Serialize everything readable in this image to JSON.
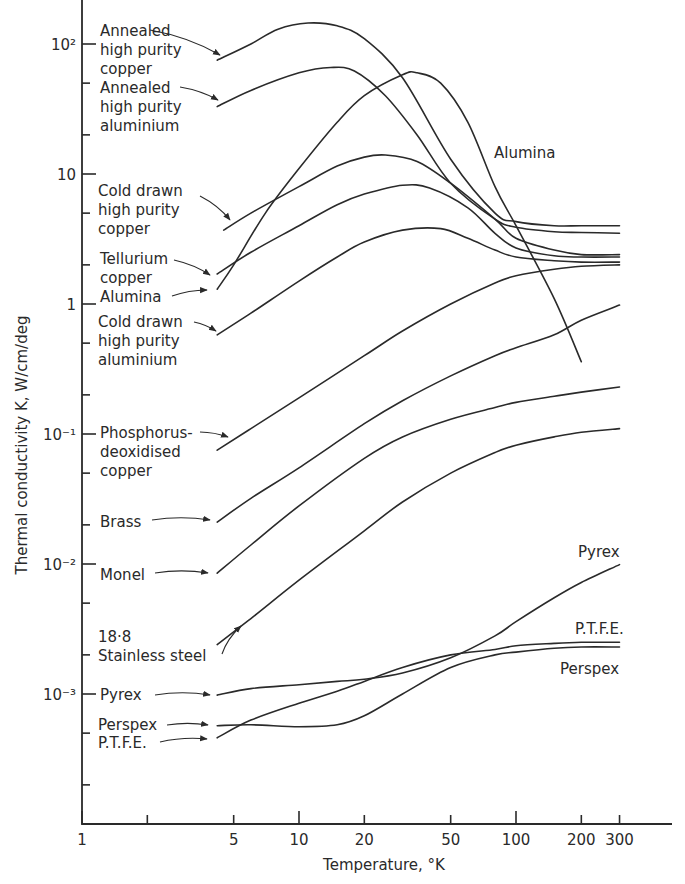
{
  "chart_data": {
    "type": "line",
    "title": "",
    "xlabel": "Temperature, °K",
    "ylabel": "Thermal conductivity K, W/cm/deg",
    "xscale": "log",
    "yscale": "log",
    "xlim": [
      1,
      400
    ],
    "ylim": [
      0.0001,
      200
    ],
    "grid": false,
    "legend": "inline labels with arrows",
    "x_ticks": [
      {
        "value": 1,
        "label": "1"
      },
      {
        "value": 2,
        "label": ""
      },
      {
        "value": 5,
        "label": "5"
      },
      {
        "value": 10,
        "label": "10"
      },
      {
        "value": 20,
        "label": "20"
      },
      {
        "value": 50,
        "label": "50"
      },
      {
        "value": 100,
        "label": "100"
      },
      {
        "value": 200,
        "label": "200"
      },
      {
        "value": 300,
        "label": "300"
      }
    ],
    "y_ticks": [
      {
        "value": 100,
        "label": "10²"
      },
      {
        "value": 10,
        "label": "10"
      },
      {
        "value": 1,
        "label": "1"
      },
      {
        "value": 0.1,
        "label": "10⁻¹"
      },
      {
        "value": 0.01,
        "label": "10⁻²"
      },
      {
        "value": 0.001,
        "label": "10⁻³"
      }
    ],
    "y_minor_ticks": [
      50,
      20,
      5,
      2,
      0.5,
      0.2,
      0.05,
      0.02,
      0.005,
      0.002,
      0.0005,
      0.0002
    ],
    "series": [
      {
        "name": "Annealed high purity copper",
        "x": [
          4.2,
          6,
          8,
          11,
          15,
          20,
          30,
          50,
          80,
          100,
          150,
          200,
          300
        ],
        "y": [
          75,
          100,
          130,
          145,
          138,
          110,
          55,
          13,
          5.0,
          4.3,
          4.0,
          4.0,
          4.0
        ]
      },
      {
        "name": "Annealed high purity aluminium",
        "x": [
          4.2,
          6,
          10,
          14,
          18,
          25,
          35,
          50,
          80,
          100,
          150,
          200,
          300
        ],
        "y": [
          33,
          44,
          60,
          66,
          62,
          40,
          20,
          8.5,
          4.5,
          3.9,
          3.6,
          3.55,
          3.5
        ]
      },
      {
        "name": "Alumina",
        "x": [
          4.2,
          5,
          7,
          10,
          15,
          20,
          30,
          35,
          45,
          60,
          80,
          100,
          150,
          200
        ],
        "y": [
          1.3,
          2.0,
          5.0,
          11,
          25,
          40,
          58,
          60,
          50,
          25,
          8,
          4.0,
          1.1,
          0.36
        ]
      },
      {
        "name": "Cold drawn high purity copper",
        "x": [
          4.5,
          6,
          10,
          15,
          20,
          25,
          35,
          50,
          80,
          100,
          150,
          200,
          300
        ],
        "y": [
          3.7,
          5.0,
          8.0,
          11.5,
          13.5,
          14,
          12.5,
          8.5,
          4.5,
          3.2,
          2.6,
          2.4,
          2.4
        ]
      },
      {
        "name": "Tellurium copper",
        "x": [
          4.2,
          6,
          10,
          15,
          20,
          30,
          40,
          60,
          80,
          100,
          150,
          200,
          300
        ],
        "y": [
          1.7,
          2.5,
          4.0,
          5.8,
          7.0,
          8.2,
          7.8,
          5.5,
          3.5,
          2.7,
          2.35,
          2.3,
          2.3
        ]
      },
      {
        "name": "Cold drawn high purity aluminium",
        "x": [
          4.2,
          6,
          10,
          15,
          20,
          30,
          45,
          60,
          80,
          100,
          150,
          200,
          300
        ],
        "y": [
          0.58,
          0.85,
          1.5,
          2.3,
          3.0,
          3.7,
          3.8,
          3.2,
          2.6,
          2.3,
          2.15,
          2.1,
          2.1
        ]
      },
      {
        "name": "Phosphorus-deoxidised copper",
        "x": [
          4.2,
          6,
          10,
          20,
          30,
          50,
          80,
          100,
          150,
          200,
          300
        ],
        "y": [
          0.075,
          0.11,
          0.19,
          0.4,
          0.62,
          1.0,
          1.45,
          1.65,
          1.85,
          1.95,
          2.0
        ]
      },
      {
        "name": "Brass",
        "x": [
          4.2,
          6,
          10,
          20,
          30,
          50,
          80,
          100,
          150,
          200,
          300
        ],
        "y": [
          0.021,
          0.032,
          0.055,
          0.12,
          0.18,
          0.28,
          0.4,
          0.46,
          0.58,
          0.75,
          0.98
        ]
      },
      {
        "name": "Monel",
        "x": [
          4.2,
          6,
          10,
          20,
          30,
          50,
          80,
          100,
          150,
          200,
          300
        ],
        "y": [
          0.0085,
          0.014,
          0.028,
          0.065,
          0.095,
          0.13,
          0.16,
          0.175,
          0.195,
          0.21,
          0.23
        ]
      },
      {
        "name": "18·8 Stainless steel",
        "x": [
          4.2,
          6,
          10,
          20,
          30,
          50,
          80,
          100,
          150,
          200,
          300
        ],
        "y": [
          0.0024,
          0.0038,
          0.0075,
          0.018,
          0.03,
          0.05,
          0.072,
          0.082,
          0.095,
          0.103,
          0.11
        ]
      },
      {
        "name": "Pyrex",
        "x": [
          4.2,
          6,
          10,
          15,
          20,
          30,
          50,
          80,
          100,
          150,
          200,
          300
        ],
        "y": [
          0.00098,
          0.0011,
          0.00118,
          0.00125,
          0.0013,
          0.00145,
          0.0019,
          0.0028,
          0.0036,
          0.0055,
          0.0072,
          0.0099
        ]
      },
      {
        "name": "P.T.F.E.",
        "x": [
          4.2,
          6,
          10,
          15,
          20,
          30,
          50,
          80,
          100,
          150,
          200,
          300
        ],
        "y": [
          0.00046,
          0.00063,
          0.00085,
          0.00105,
          0.00125,
          0.0016,
          0.002,
          0.0022,
          0.00235,
          0.00245,
          0.0025,
          0.0025
        ]
      },
      {
        "name": "Perspex",
        "x": [
          4.2,
          6,
          10,
          15,
          20,
          30,
          50,
          80,
          100,
          150,
          200,
          300
        ],
        "y": [
          0.00057,
          0.00058,
          0.00056,
          0.00058,
          0.00068,
          0.001,
          0.0016,
          0.002,
          0.0021,
          0.00225,
          0.0023,
          0.0023
        ]
      }
    ],
    "annotations": [
      {
        "text": [
          "Annealed",
          "high purity",
          "copper"
        ],
        "x": 100,
        "y": 36,
        "arrow_from": [
          150,
          30
        ],
        "arrow_to": [
          220,
          55
        ]
      },
      {
        "text": [
          "Annealed",
          "high purity",
          "aluminium"
        ],
        "x": 100,
        "y": 93,
        "arrow_from": [
          180,
          87
        ],
        "arrow_to": [
          218,
          100
        ]
      },
      {
        "text": [
          "Cold drawn",
          "high purity",
          "copper"
        ],
        "x": 98,
        "y": 196,
        "arrow_from": [
          200,
          196
        ],
        "arrow_to": [
          230,
          220
        ]
      },
      {
        "text": [
          "Tellurium",
          "copper"
        ],
        "x": 100,
        "y": 264,
        "arrow_from": [
          174,
          260
        ],
        "arrow_to": [
          210,
          275
        ]
      },
      {
        "text": [
          "Alumina"
        ],
        "x": 100,
        "y": 302,
        "arrow_from": [
          172,
          296
        ],
        "arrow_to": [
          207,
          290
        ]
      },
      {
        "text": [
          "Cold drawn",
          "high purity",
          "aluminium"
        ],
        "x": 98,
        "y": 327,
        "arrow_from": [
          194,
          322
        ],
        "arrow_to": [
          216,
          331
        ]
      },
      {
        "text": [
          "Phosphorus-",
          "deoxidised",
          "copper"
        ],
        "x": 100,
        "y": 438,
        "arrow_from": [
          200,
          432
        ],
        "arrow_to": [
          228,
          437
        ]
      },
      {
        "text": [
          "Brass"
        ],
        "x": 100,
        "y": 527,
        "arrow_from": [
          152,
          520
        ],
        "arrow_to": [
          210,
          520
        ]
      },
      {
        "text": [
          "Monel"
        ],
        "x": 100,
        "y": 580,
        "arrow_from": [
          155,
          573
        ],
        "arrow_to": [
          208,
          573
        ]
      },
      {
        "text": [
          "18·8",
          "Stainless steel"
        ],
        "x": 98,
        "y": 642,
        "arrow_from": [
          222,
          654
        ],
        "arrow_to": [
          241,
          626
        ]
      },
      {
        "text": [
          "Pyrex"
        ],
        "x": 100,
        "y": 700,
        "arrow_from": [
          155,
          695
        ],
        "arrow_to": [
          210,
          695
        ]
      },
      {
        "text": [
          "Perspex"
        ],
        "x": 98,
        "y": 730,
        "arrow_from": [
          167,
          725
        ],
        "arrow_to": [
          208,
          725
        ]
      },
      {
        "text": [
          "P.T.F.E."
        ],
        "x": 98,
        "y": 748,
        "arrow_from": [
          160,
          742
        ],
        "arrow_to": [
          207,
          739
        ]
      },
      {
        "text": [
          "Alumina"
        ],
        "x": 494,
        "y": 158
      },
      {
        "text": [
          "Pyrex"
        ],
        "x": 578,
        "y": 557
      },
      {
        "text": [
          "P.T.F.E."
        ],
        "x": 575,
        "y": 634
      },
      {
        "text": [
          "Perspex"
        ],
        "x": 560,
        "y": 674
      }
    ]
  }
}
